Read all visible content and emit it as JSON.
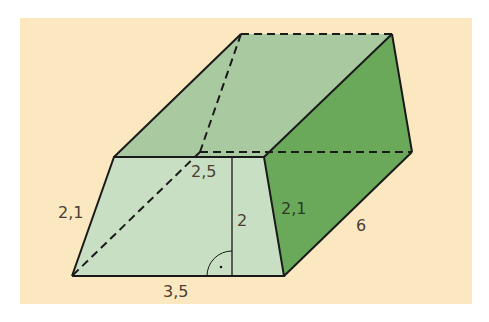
{
  "diagram": {
    "type": "trapezoidal-prism",
    "colors": {
      "background": "#fbe8c0",
      "top_face": "#a9c9a0",
      "front_face": "#c9dfc4",
      "side_face": "#6aa95a",
      "edges": "#1a1a1a"
    },
    "labels": {
      "top_side": "2,5",
      "left_side": "2,1",
      "right_side": "2,1",
      "height": "2",
      "bottom_side": "3,5",
      "length": "6"
    },
    "right_angle_marker": "·"
  }
}
